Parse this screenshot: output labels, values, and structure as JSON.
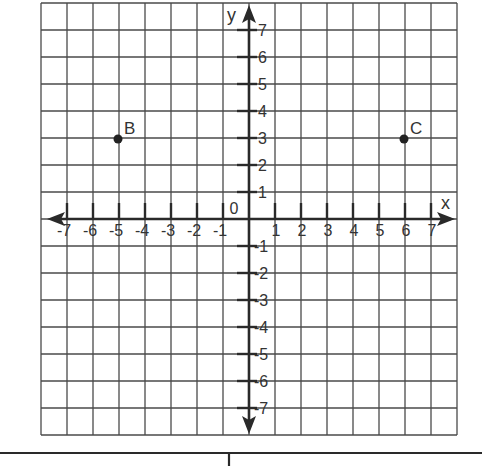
{
  "chart_data": {
    "type": "scatter",
    "title": "",
    "xlabel": "x",
    "ylabel": "y",
    "xlim": [
      -8,
      8
    ],
    "ylim": [
      -8,
      8
    ],
    "grid": true,
    "origin_label": "0",
    "x_ticks": [
      -7,
      -6,
      -5,
      -4,
      -3,
      -2,
      -1,
      1,
      2,
      3,
      4,
      5,
      6,
      7
    ],
    "y_ticks": [
      -7,
      -6,
      -5,
      -4,
      -3,
      -2,
      -1,
      1,
      2,
      3,
      4,
      5,
      6,
      7
    ],
    "points": [
      {
        "label": "B",
        "x": -5,
        "y": 3
      },
      {
        "label": "C",
        "x": 6,
        "y": 3
      }
    ],
    "legend": null
  },
  "colors": {
    "grid": "#4a4a4a",
    "axis": "#2a2a2a",
    "text": "#333333",
    "point": "#222222",
    "background": "#ffffff"
  }
}
